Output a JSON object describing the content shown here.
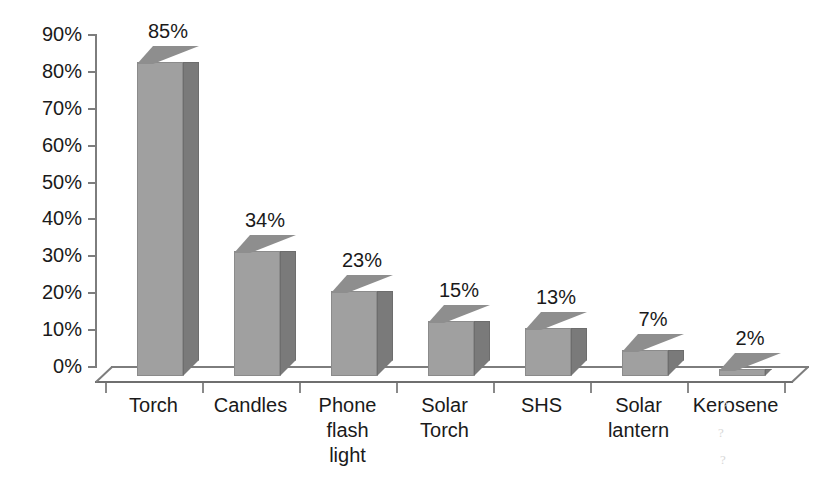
{
  "chart_data": {
    "type": "bar",
    "title": "",
    "subtitle": "",
    "xlabel": "",
    "ylabel": "",
    "categories": [
      "Torch",
      "Candles",
      "Phone flash light",
      "Solar Torch",
      "SHS",
      "Solar lantern",
      "Kerosene"
    ],
    "category_lines": [
      [
        "Torch"
      ],
      [
        "Candles"
      ],
      [
        "Phone",
        "flash",
        "light"
      ],
      [
        "Solar",
        "Torch"
      ],
      [
        "SHS"
      ],
      [
        "Solar",
        "lantern"
      ],
      [
        "Kerosene"
      ]
    ],
    "values": [
      85,
      34,
      23,
      15,
      13,
      7,
      2
    ],
    "data_labels": [
      "85%",
      "34%",
      "23%",
      "15%",
      "13%",
      "7%",
      "2%"
    ],
    "ylim": [
      0,
      90
    ],
    "ytick_values": [
      0,
      10,
      20,
      30,
      40,
      50,
      60,
      70,
      80,
      90
    ],
    "ytick_labels": [
      "0%",
      "10%",
      "20%",
      "30%",
      "40%",
      "50%",
      "60%",
      "70%",
      "80%",
      "90%"
    ],
    "grid": false,
    "legend": false,
    "legend_position": "none",
    "style": "3d-column",
    "colors": {
      "bar_front": "#a0a0a0",
      "bar_side": "#7a7a7a",
      "bar_top": "#8e8e8e",
      "axis": "#7d7d7d",
      "text": "#1a1a1a",
      "background": "#ffffff"
    }
  },
  "artifacts": [
    "?",
    "?",
    "?"
  ]
}
